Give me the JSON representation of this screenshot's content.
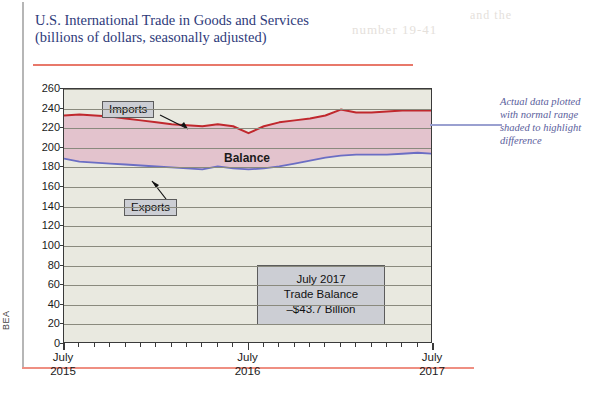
{
  "figure": {
    "title_line1": "U.S. International Trade in Goods and Services",
    "title_line2": "(billions of dollars, seasonally adjusted)",
    "source_label": "BEA"
  },
  "labels": {
    "imports": "Imports",
    "exports": "Exports",
    "balance": "Balance"
  },
  "stat_box": {
    "line1": "July 2017",
    "line2": "Trade Balance",
    "line3": "–$43.7 Billion"
  },
  "annotation": {
    "line1": "Actual data plotted",
    "line2": "with normal range",
    "line3": "shaded to highlight",
    "line4": "difference"
  },
  "ghost_text": {
    "g1": "number 19-41",
    "g2": "and the",
    "g3": "figure"
  },
  "colors": {
    "imports_line": "#c0282d",
    "exports_line": "#6b6ec4",
    "balance_fill": "#e3c3cd",
    "plot_background": "#e9e9e0",
    "gridline": "#8a8a7e",
    "title_text": "#2e3a7a",
    "title_rule": "#e8786a",
    "page_rule": "#ef8f82",
    "callout_fill": "#ccced4",
    "annotation_text": "#5a5e9c",
    "leader_line": "#9aa0d0"
  },
  "chart_data": {
    "type": "area",
    "title": "U.S. International Trade in Goods and Services (billions of dollars, seasonally adjusted)",
    "xlabel": "",
    "ylabel": "billions of dollars",
    "ylim": [
      0,
      260
    ],
    "yticks": [
      0,
      20,
      40,
      60,
      80,
      100,
      120,
      140,
      160,
      180,
      200,
      220,
      240,
      260
    ],
    "grid": true,
    "legend": "inline-callouts",
    "x_tick_labels": [
      {
        "line1": "July",
        "line2": "2015",
        "index": 0
      },
      {
        "line1": "July",
        "line2": "2016",
        "index": 12
      },
      {
        "line1": "July",
        "line2": "2017",
        "index": 24
      }
    ],
    "x": [
      "Jul 2015",
      "Aug 2015",
      "Sep 2015",
      "Oct 2015",
      "Nov 2015",
      "Dec 2015",
      "Jan 2016",
      "Feb 2016",
      "Mar 2016",
      "Apr 2016",
      "May 2016",
      "Jun 2016",
      "Jul 2016",
      "Aug 2016",
      "Sep 2016",
      "Oct 2016",
      "Nov 2016",
      "Dec 2016",
      "Jan 2017",
      "Feb 2017",
      "Mar 2017",
      "Apr 2017",
      "May 2017",
      "Jun 2017",
      "Jul 2017"
    ],
    "series": [
      {
        "name": "Imports",
        "color": "#c0282d",
        "values": [
          233,
          234,
          233,
          232,
          230,
          228,
          226,
          224,
          223,
          222,
          224,
          222,
          215,
          222,
          226,
          228,
          230,
          233,
          239,
          236,
          236,
          237,
          238,
          238,
          238
        ]
      },
      {
        "name": "Exports",
        "color": "#6b6ec4",
        "values": [
          189,
          186,
          185,
          184,
          183,
          182,
          181,
          180,
          179,
          178,
          181,
          179,
          178,
          179,
          181,
          184,
          187,
          190,
          192,
          193,
          193,
          193,
          194,
          195,
          194
        ]
      }
    ],
    "shaded_band": {
      "name": "Balance",
      "between": [
        "Exports",
        "Imports"
      ],
      "fill": "#e3c3cd"
    },
    "annotations": [
      {
        "text": "Imports",
        "type": "callout-box"
      },
      {
        "text": "Exports",
        "type": "callout-box"
      },
      {
        "text": "Balance",
        "type": "inline-label"
      },
      {
        "text": "July 2017 Trade Balance –$43.7 Billion",
        "type": "stat-box"
      }
    ]
  }
}
